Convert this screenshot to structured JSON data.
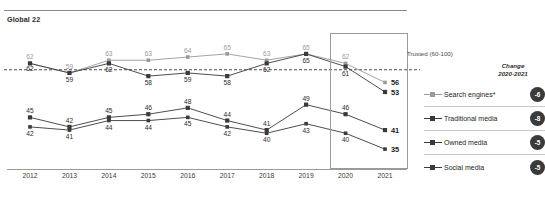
{
  "chart_data": {
    "type": "line",
    "title": "Global 22",
    "xlabel": "",
    "ylabel": "",
    "x": [
      "2012",
      "2013",
      "2014",
      "2015",
      "2016",
      "2017",
      "2018",
      "2019",
      "2020",
      "2021"
    ],
    "categories": [
      "2012",
      "2013",
      "2014",
      "2015",
      "2016",
      "2017",
      "2018",
      "2019",
      "2020",
      "2021"
    ],
    "ylim": [
      30,
      70
    ],
    "grid": false,
    "legend_position": "right",
    "series": [
      {
        "name": "Search engines*",
        "color": "#9a9a9a",
        "values": [
          62,
          59,
          63,
          63,
          64,
          65,
          63,
          65,
          62,
          56
        ],
        "change": "-6"
      },
      {
        "name": "Traditional media",
        "color": "#3a3a3a",
        "values": [
          62,
          59,
          62,
          58,
          59,
          58,
          62,
          65,
          61,
          53
        ],
        "change": "-8"
      },
      {
        "name": "Owned media",
        "color": "#3a3a3a",
        "values": [
          45,
          42,
          45,
          46,
          48,
          44,
          41,
          49,
          46,
          41
        ],
        "change": "-5"
      },
      {
        "name": "Social media",
        "color": "#3a3a3a",
        "values": [
          42,
          41,
          44,
          44,
          45,
          42,
          40,
          43,
          40,
          35
        ],
        "change": "-5"
      }
    ],
    "annotations": [
      {
        "text": "Trusted (60-100)",
        "type": "threshold-label",
        "value": 60
      }
    ],
    "threshold": {
      "value": 60,
      "label": "Trusted (60-100)",
      "style": "dashed"
    },
    "highlight": {
      "from": "2020",
      "to": "2021"
    }
  },
  "legend": {
    "header_line1": "Change",
    "header_line2": "2020-2021",
    "rows": [
      {
        "label": "Search engines*",
        "change": "-6"
      },
      {
        "label": "Traditional media",
        "change": "-8"
      },
      {
        "label": "Owned media",
        "change": "-5"
      },
      {
        "label": "Social media",
        "change": "-5"
      }
    ]
  },
  "colors": {
    "light_series": "#9a9a9a",
    "dark_series": "#3a3a3a",
    "badge_bg": "#3a3a3a",
    "axis": "#9a9a9a"
  }
}
